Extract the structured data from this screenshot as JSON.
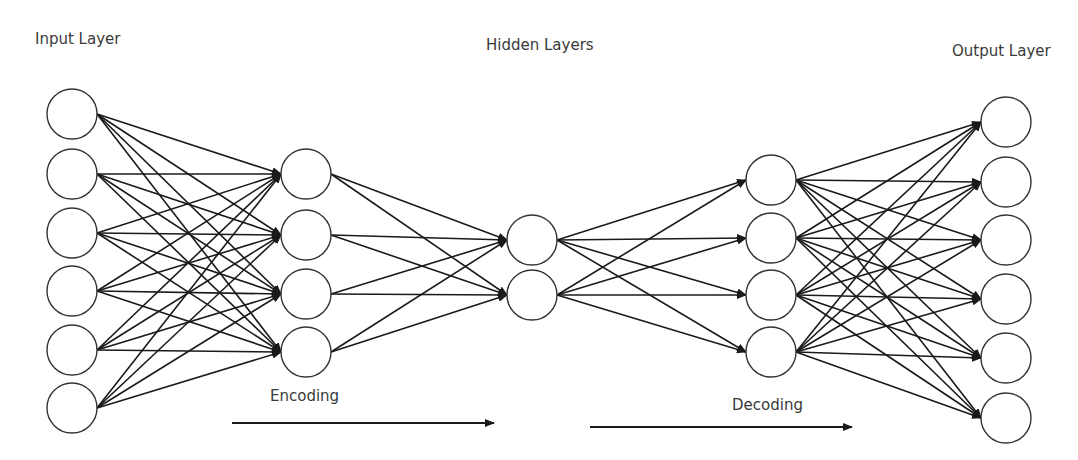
{
  "labels": {
    "input_layer": "Input Layer",
    "hidden_layers": "Hidden Layers",
    "output_layer": "Output Layer",
    "encoding": "Encoding",
    "decoding": "Decoding"
  },
  "colors": {
    "stroke": "#1a1a1a",
    "node_fill": "#ffffff",
    "text": "#3a3a3a"
  },
  "node_radius": 25,
  "layers": [
    {
      "name": "input",
      "cx": 72,
      "cy": [
        114,
        174,
        233,
        291,
        350,
        408
      ]
    },
    {
      "name": "hidden-1",
      "cx": 306,
      "cy": [
        174,
        235,
        294,
        352
      ]
    },
    {
      "name": "bottleneck",
      "cx": 532,
      "cy": [
        240,
        295
      ]
    },
    {
      "name": "hidden-3",
      "cx": 771,
      "cy": [
        180,
        238,
        295,
        352
      ]
    },
    {
      "name": "output",
      "cx": 1006,
      "cy": [
        122,
        182,
        240,
        299,
        358,
        418
      ]
    }
  ],
  "arrows": [
    {
      "name": "encoding-arrow",
      "x1": 232,
      "x2": 494,
      "y": 423
    },
    {
      "name": "decoding-arrow",
      "x1": 590,
      "x2": 852,
      "y": 427
    }
  ]
}
